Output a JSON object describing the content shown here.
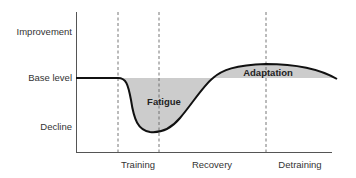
{
  "diagram": {
    "y_axis": {
      "labels": [
        {
          "text": "Improvement",
          "y": 32
        },
        {
          "text": "Base level",
          "y": 78
        },
        {
          "text": "Decline",
          "y": 127
        }
      ]
    },
    "x_axis": {
      "labels": [
        {
          "text": "Training",
          "x": 138
        },
        {
          "text": "Recovery",
          "x": 212
        },
        {
          "text": "Detraining",
          "x": 300
        }
      ]
    },
    "dividers_x": [
      118,
      159,
      266
    ],
    "regions": {
      "fatigue": "Fatigue",
      "adaptation": "Adaptation"
    },
    "colors": {
      "curve": "#111111",
      "fill": "#cccccc",
      "axis": "#555555",
      "divider": "#666666",
      "text": "#333333"
    }
  }
}
